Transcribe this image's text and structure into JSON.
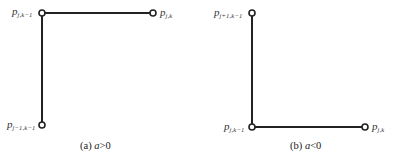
{
  "panels": [
    {
      "id": "a",
      "caption_prefix": "(a) ",
      "caption_var": "a",
      "caption_rel": ">0",
      "nodes": [
        {
          "name": "p",
          "sub": "j,k−1",
          "x": 42,
          "y": 13
        },
        {
          "name": "p",
          "sub": "j,k",
          "x": 153,
          "y": 13
        },
        {
          "name": "p",
          "sub": "j−1,k−1",
          "x": 42,
          "y": 125
        }
      ],
      "edges": [
        [
          0,
          1
        ],
        [
          0,
          2
        ]
      ]
    },
    {
      "id": "b",
      "caption_prefix": "(b) ",
      "caption_var": "a",
      "caption_rel": "<0",
      "nodes": [
        {
          "name": "p",
          "sub": "j+1,k−1",
          "x": 252,
          "y": 13
        },
        {
          "name": "p",
          "sub": "j,k−1",
          "x": 252,
          "y": 127
        },
        {
          "name": "p",
          "sub": "j,k",
          "x": 365,
          "y": 127
        }
      ],
      "edges": [
        [
          0,
          1
        ],
        [
          1,
          2
        ]
      ]
    }
  ],
  "colors": {
    "line": "#222222",
    "node_fill": "#ffffff",
    "node_stroke": "#222222"
  }
}
